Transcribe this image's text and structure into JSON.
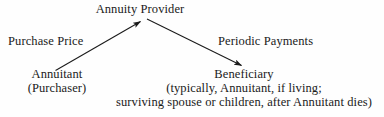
{
  "diagram": {
    "type": "flow-diagram",
    "background_color": "#fefefe",
    "text_color": "#1a1a1a",
    "nodes": {
      "provider": {
        "label": "Annuity Provider"
      },
      "annuitant": {
        "line1": "Annuitant",
        "line2": "(Purchaser)"
      },
      "beneficiary": {
        "line1": "Beneficiary",
        "line2": "(typically, Annuitant, if living;",
        "line3": "surviving spouse or children, after Annuitant dies)"
      }
    },
    "edges": {
      "purchase": {
        "label": "Purchase Price",
        "from": "annuitant",
        "to": "provider"
      },
      "payments": {
        "label": "Periodic Payments",
        "from": "provider",
        "to": "beneficiary"
      }
    }
  }
}
